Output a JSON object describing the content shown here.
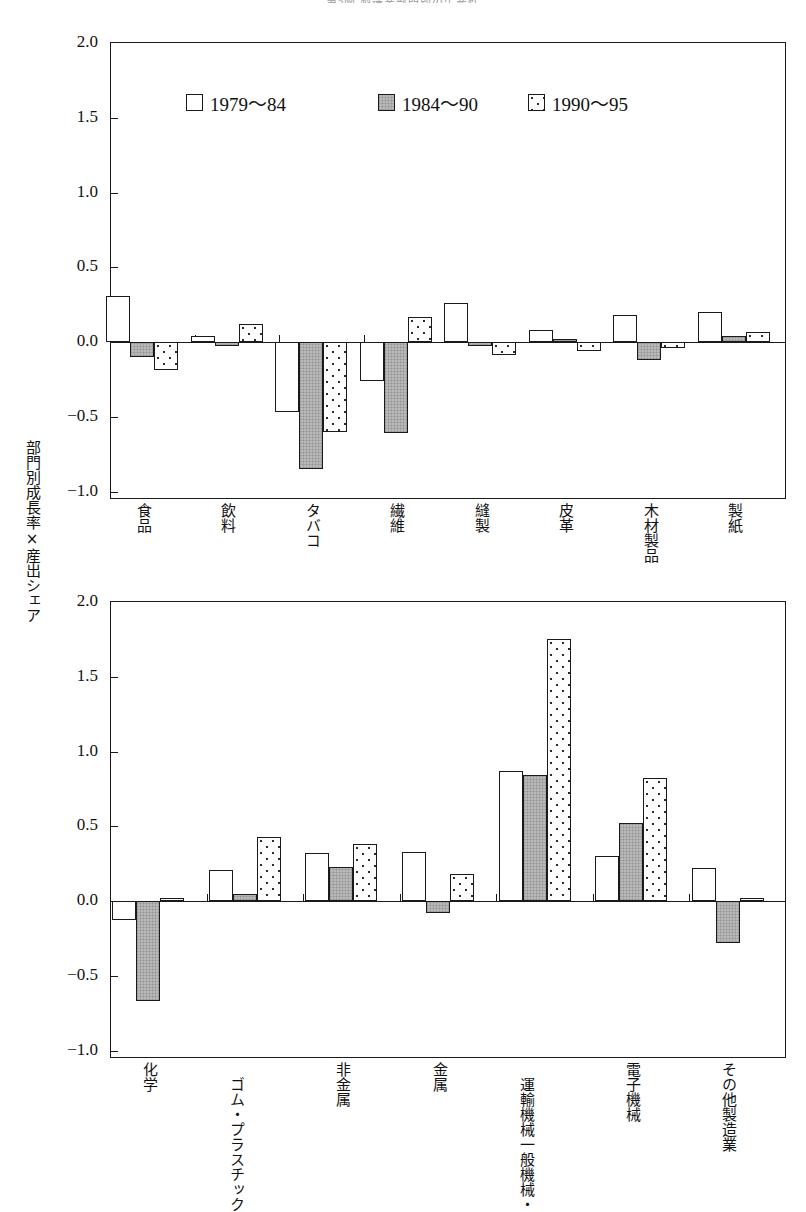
{
  "figure": {
    "title": "第3図 製造業部門別の生産性",
    "y_axis_caption": "部門別成長率×産出シェア"
  },
  "legend": {
    "items": [
      {
        "label": "1979~84",
        "style": "white-open-square",
        "swatch": "open"
      },
      {
        "label": "1984~90",
        "style": "gray-filled-square",
        "swatch": "gray"
      },
      {
        "label": "1990~95",
        "style": "dotted-square",
        "swatch": "dotted"
      }
    ]
  },
  "chart_data": [
    {
      "type": "bar",
      "id": "upper-panel",
      "title": "",
      "xlabel": "",
      "ylabel": "部門別成長率×産出シェア",
      "ylim": [
        -1.0,
        2.0
      ],
      "yticks": [
        "2.0",
        "1.5",
        "1.0",
        "0.5",
        "0.0",
        "-0.5",
        "-1.0"
      ],
      "ytick_values": [
        2.0,
        1.5,
        1.0,
        0.5,
        0.0,
        -0.5,
        -1.0
      ],
      "grid": false,
      "legend_position": "inside-top-left",
      "categories": [
        "食品",
        "飲料",
        "タバコ",
        "繊維",
        "縫製",
        "皮革",
        "木材製品",
        "製紙"
      ],
      "series": [
        {
          "name": "1979~84",
          "values": [
            0.31,
            0.04,
            -0.47,
            -0.26,
            0.26,
            0.08,
            0.18,
            0.2
          ]
        },
        {
          "name": "1984~90",
          "values": [
            -0.1,
            -0.03,
            -0.85,
            -0.61,
            -0.03,
            0.02,
            -0.12,
            0.04
          ]
        },
        {
          "name": "1990~95",
          "values": [
            -0.19,
            0.12,
            -0.6,
            0.17,
            -0.09,
            -0.06,
            -0.04,
            0.07
          ]
        }
      ]
    },
    {
      "type": "bar",
      "id": "lower-panel",
      "title": "",
      "xlabel": "",
      "ylabel": "部門別成長率×産出シェア",
      "ylim": [
        -1.0,
        2.0
      ],
      "yticks": [
        "2.0",
        "1.5",
        "1.0",
        "0.5",
        "0.0",
        "-0.5",
        "-1.0"
      ],
      "ytick_values": [
        2.0,
        1.5,
        1.0,
        0.5,
        0.0,
        -0.5,
        -1.0
      ],
      "grid": false,
      "legend_position": "none",
      "categories": [
        "化学",
        "ゴム・プラスチック",
        "非金属",
        "金属",
        "一般機械・運輸機械",
        "電子機械",
        "その他製造業"
      ],
      "series": [
        {
          "name": "1979~84",
          "values": [
            -0.13,
            0.21,
            0.32,
            0.33,
            0.87,
            0.3,
            0.22
          ]
        },
        {
          "name": "1984~90",
          "values": [
            -0.67,
            0.05,
            0.23,
            -0.08,
            0.84,
            0.52,
            -0.28
          ]
        },
        {
          "name": "1990~95",
          "values": [
            0.02,
            0.43,
            0.38,
            0.18,
            1.75,
            0.82,
            0.02
          ]
        }
      ]
    }
  ],
  "colors": {
    "axis": "#1a1a1a",
    "series_1979_84": "#ffffff",
    "series_1984_90": "#b9b9b9",
    "series_1990_95": "#fdfdfd",
    "text": "#111111"
  }
}
